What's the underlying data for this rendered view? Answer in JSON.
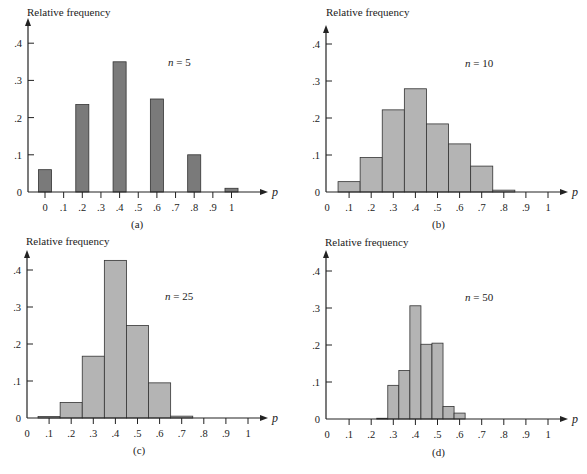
{
  "chart_data": [
    {
      "id": "a",
      "type": "bar",
      "title": "n = 5",
      "n": 5,
      "caption": "(a)",
      "xlabel": "p",
      "ylabel": "Relative frequency",
      "yticks": [
        "0",
        ".1",
        ".2",
        ".3",
        ".4"
      ],
      "xticks": [
        "0",
        ".1",
        ".2",
        ".3",
        ".4",
        ".5",
        ".6",
        ".7",
        ".8",
        ".9",
        "1"
      ],
      "ylim": [
        0,
        0.4
      ],
      "bar_width": 0.07,
      "bar_color": "#7a7a7a",
      "x": [
        0,
        0.2,
        0.4,
        0.6,
        0.8,
        1.0
      ],
      "values": [
        0.06,
        0.235,
        0.35,
        0.25,
        0.1,
        0.01
      ]
    },
    {
      "id": "b",
      "type": "bar",
      "title": "n = 10",
      "n": 10,
      "caption": "(b)",
      "xlabel": "p",
      "ylabel": "Relative frequency",
      "yticks": [
        "0",
        ".1",
        ".2",
        ".3",
        ".4"
      ],
      "xticks": [
        "0",
        ".1",
        ".2",
        ".3",
        ".4",
        ".5",
        ".6",
        ".7",
        ".8",
        ".9",
        "1"
      ],
      "ylim": [
        0,
        0.4
      ],
      "bar_width": 0.1,
      "bar_color": "#b4b4b4",
      "x": [
        0.1,
        0.2,
        0.3,
        0.4,
        0.5,
        0.6,
        0.7,
        0.8
      ],
      "values": [
        0.028,
        0.093,
        0.222,
        0.279,
        0.184,
        0.13,
        0.07,
        0.005
      ]
    },
    {
      "id": "c",
      "type": "bar",
      "title": "n = 25",
      "n": 25,
      "caption": "(c)",
      "xlabel": "p",
      "ylabel": "Relative frequency",
      "yticks": [
        "0",
        ".1",
        ".2",
        ".3",
        ".4"
      ],
      "xticks": [
        "0",
        ".1",
        ".2",
        ".3",
        ".4",
        ".5",
        ".6",
        ".7",
        ".8",
        ".9",
        "1"
      ],
      "ylim": [
        0,
        0.4
      ],
      "bar_width": 0.1,
      "bar_color": "#b4b4b4",
      "x": [
        0.1,
        0.2,
        0.3,
        0.4,
        0.5,
        0.6,
        0.7
      ],
      "values": [
        0.004,
        0.042,
        0.167,
        0.426,
        0.25,
        0.095,
        0.005
      ]
    },
    {
      "id": "d",
      "type": "bar",
      "title": "n = 50",
      "n": 50,
      "caption": "(d)",
      "xlabel": "p",
      "ylabel": "Relative frequency",
      "yticks": [
        "0",
        ".1",
        ".2",
        ".3",
        ".4"
      ],
      "xticks": [
        "0",
        ".1",
        ".2",
        ".3",
        ".4",
        ".5",
        ".6",
        ".7",
        ".8",
        ".9",
        "1"
      ],
      "ylim": [
        0,
        0.4
      ],
      "bar_width": 0.05,
      "bar_color": "#b4b4b4",
      "x": [
        0.25,
        0.3,
        0.35,
        0.4,
        0.45,
        0.5,
        0.55,
        0.6
      ],
      "values": [
        0.002,
        0.091,
        0.131,
        0.306,
        0.202,
        0.205,
        0.034,
        0.016
      ]
    }
  ],
  "panels": [
    {
      "ylabel": "Relative frequency",
      "n_label": "n",
      "n_value": "= 5",
      "caption": "(a)",
      "xlabel": "p"
    },
    {
      "ylabel": "Relative frequency",
      "n_label": "n",
      "n_value": "= 10",
      "caption": "(b)",
      "xlabel": "p"
    },
    {
      "ylabel": "Relative frequency",
      "n_label": "n",
      "n_value": "= 25",
      "caption": "(c)",
      "xlabel": "p"
    },
    {
      "ylabel": "Relative frequency",
      "n_label": "n",
      "n_value": "= 50",
      "caption": "(d)",
      "xlabel": "p"
    }
  ]
}
